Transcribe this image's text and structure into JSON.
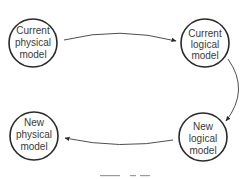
{
  "diagram": {
    "type": "cycle-flow",
    "nodes": [
      {
        "id": "current-physical",
        "lines": [
          "Current",
          "physical",
          "model"
        ]
      },
      {
        "id": "current-logical",
        "lines": [
          "Current",
          "logical",
          "model"
        ]
      },
      {
        "id": "new-logical",
        "lines": [
          "New",
          "logical",
          "model"
        ]
      },
      {
        "id": "new-physical",
        "lines": [
          "New",
          "physical",
          "model"
        ]
      }
    ],
    "edges": [
      {
        "from": "current-physical",
        "to": "current-logical"
      },
      {
        "from": "current-logical",
        "to": "new-logical"
      },
      {
        "from": "new-logical",
        "to": "new-physical"
      }
    ],
    "caption": "Figure"
  }
}
